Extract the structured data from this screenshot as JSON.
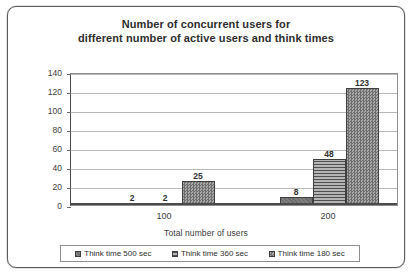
{
  "chart_data": {
    "type": "bar",
    "title": "Number of concurrent users for different number of active users and think times",
    "title_lines": [
      "Number of concurrent users for",
      "different number of active users and think times"
    ],
    "xlabel": "Total number of users",
    "ylabel": "",
    "categories": [
      "100",
      "200"
    ],
    "ylim": [
      0,
      140
    ],
    "yticks": [
      0,
      20,
      40,
      60,
      80,
      100,
      120,
      140
    ],
    "ytick_labels": [
      "0",
      "20",
      "40",
      "60",
      "80",
      "100",
      "120",
      "140"
    ],
    "grid": true,
    "legend_position": "bottom",
    "series": [
      {
        "name": "Think time 500 sec",
        "values": [
          2,
          8
        ],
        "labels": [
          "2",
          "8"
        ],
        "fill": "solid",
        "color": "#7d7d7d"
      },
      {
        "name": "Think time 360 sec",
        "values": [
          2,
          48
        ],
        "labels": [
          "2",
          "48"
        ],
        "fill": "horizontal-stripes",
        "color": "#9a9a9a"
      },
      {
        "name": "Think time 180 sec",
        "values": [
          25,
          123
        ],
        "labels": [
          "25",
          "123"
        ],
        "fill": "checker",
        "color": "#8b8b8b"
      }
    ]
  }
}
